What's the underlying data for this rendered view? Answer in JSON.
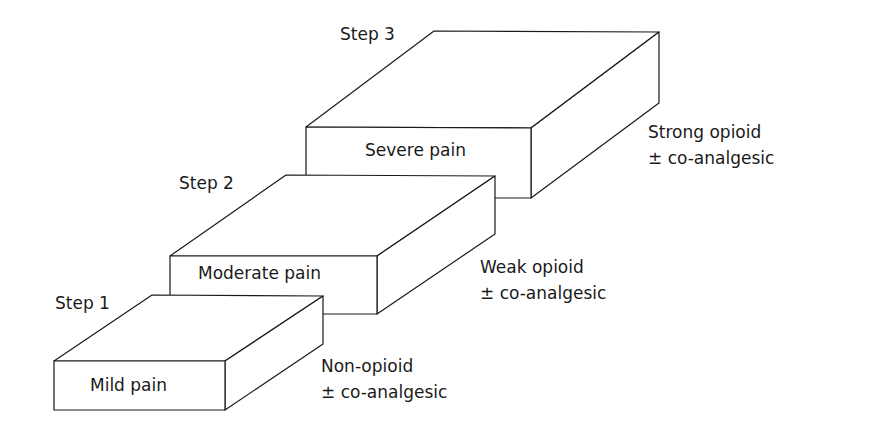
{
  "diagram": {
    "type": "staircase",
    "steps": [
      {
        "step_label": "Step 1",
        "box_label": "Mild pain",
        "treatment_line1": "Non-opioid",
        "treatment_line2": "± co-analgesic"
      },
      {
        "step_label": "Step 2",
        "box_label": "Moderate pain",
        "treatment_line1": "Weak opioid",
        "treatment_line2": "± co-analgesic"
      },
      {
        "step_label": "Step 3",
        "box_label": "Severe pain",
        "treatment_line1": "Strong opioid",
        "treatment_line2": "± co-analgesic"
      }
    ],
    "colors": {
      "stroke": "#1a1a1a",
      "fill": "#ffffff"
    }
  }
}
